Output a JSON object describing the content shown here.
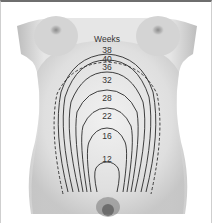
{
  "figure": {
    "title": "Weeks",
    "contours": [
      {
        "week": "38",
        "style": "solid",
        "label_y": 44
      },
      {
        "week": "40",
        "style": "solid",
        "label_y": 53
      },
      {
        "week": "36",
        "style": "dashed",
        "label_y": 62
      },
      {
        "week": "32",
        "style": "solid",
        "label_y": 76
      },
      {
        "week": "28",
        "style": "solid",
        "label_y": 94
      },
      {
        "week": "22",
        "style": "solid",
        "label_y": 112
      },
      {
        "week": "16",
        "style": "solid",
        "label_y": 132
      },
      {
        "week": "12",
        "style": "solid",
        "label_y": 156
      }
    ]
  }
}
